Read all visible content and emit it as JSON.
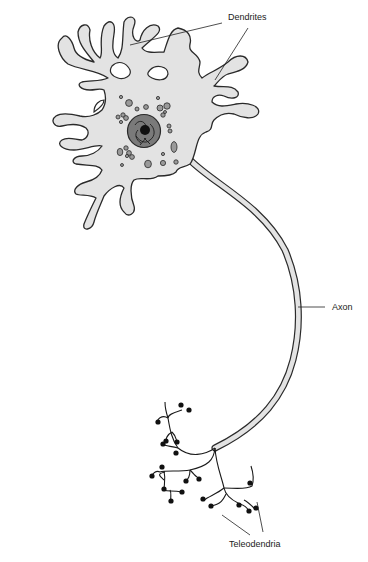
{
  "diagram": {
    "labels": {
      "dendrites": "Dendrites",
      "axon": "Axon",
      "teleodendria": "Teleodendria"
    },
    "colors": {
      "cytoplasm": "#e3e3e3",
      "outline": "#2a2a2a",
      "nucleus": "#7a7a7a",
      "nucleolus": "#111111",
      "organelles": "#9a9a9a",
      "terminal_bulbs": "#111111",
      "background": "#ffffff"
    }
  }
}
